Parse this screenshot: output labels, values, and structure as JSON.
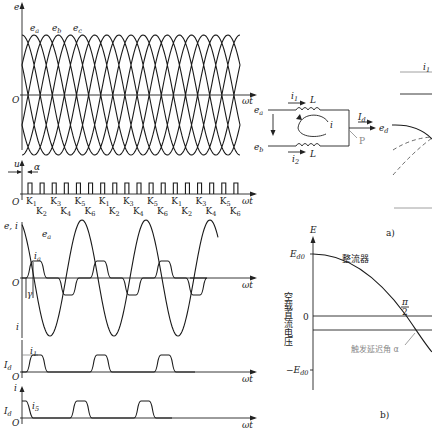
{
  "left_figure": {
    "panel_1": {
      "y_label": "e",
      "x_label": "ωt",
      "origin": "O",
      "curves": [
        "e_a",
        "e_b",
        "e_c"
      ],
      "cycles_shown": 3
    },
    "panel_2": {
      "y_label": "u",
      "x_label": "ωt",
      "origin": "O",
      "angle_label": "α",
      "pulse_labels_top": [
        "K1",
        "K3",
        "K5",
        "K1",
        "K3",
        "K5",
        "K1",
        "K3",
        "K5"
      ],
      "pulse_labels_bottom": [
        "K2",
        "K4",
        "K6",
        "K2",
        "K4",
        "K6",
        "K2",
        "K4",
        "K6"
      ]
    },
    "panel_3": {
      "y_label": "e, i",
      "x_label": "ωt",
      "origin": "O",
      "curve_labels": [
        "e_a",
        "i_a"
      ],
      "angle_label": "γ",
      "lower_label": "i"
    },
    "panel_4": {
      "x_label": "ωt",
      "origin": "O",
      "level_label": "I_d",
      "curve_label": "i_1"
    },
    "panel_5": {
      "y_label": "i",
      "x_label": "ωt",
      "origin": "O",
      "level_label": "I_d",
      "curve_label": "i_5"
    }
  },
  "right_figure": {
    "panel_a": {
      "caption": "a)",
      "nodes": [
        "e_a",
        "e_b",
        "e_d"
      ],
      "currents": [
        "i_1",
        "i_2",
        "I_d",
        "i"
      ],
      "inductors": [
        "L",
        "L"
      ],
      "point_label": "P",
      "top_label": "i_1"
    },
    "panel_b": {
      "caption": "b)",
      "y_label": "E",
      "y_ticks": [
        "E_d0",
        "0",
        "−E_d0"
      ],
      "curve_label": "整流器",
      "y_axis_title": "空载直流电压",
      "x_annotation": "触发延迟角 α",
      "mid_label": "π/2"
    }
  },
  "caption": {
    "bottom": ""
  }
}
